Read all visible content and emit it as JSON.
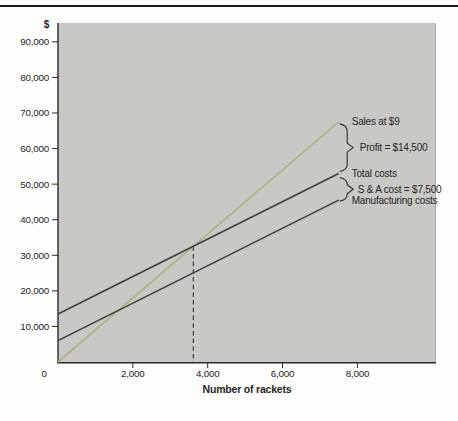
{
  "chart_data": {
    "type": "line",
    "title": "",
    "xlabel": "Number of rackets",
    "ylabel": "$",
    "xlim": [
      0,
      10100
    ],
    "ylim": [
      0,
      95300
    ],
    "x_ticks": [
      0,
      2000,
      4000,
      6000,
      8000
    ],
    "y_ticks": [
      10000,
      20000,
      30000,
      40000,
      50000,
      60000,
      70000,
      80000,
      90000
    ],
    "grid": false,
    "legend_position": "right-annotations",
    "plot_bg_color": "#c9c8c5",
    "series": [
      {
        "name": "Sales at $9",
        "color": "#b5b08a",
        "width": 1.8,
        "points": [
          [
            0,
            0
          ],
          [
            7500,
            67500
          ]
        ]
      },
      {
        "name": "Total costs",
        "color": "#3f3f3d",
        "width": 1.6,
        "points": [
          [
            0,
            13500
          ],
          [
            7500,
            53000
          ]
        ]
      },
      {
        "name": "Manufacturing costs",
        "color": "#3f3f3d",
        "width": 1.6,
        "points": [
          [
            0,
            6000
          ],
          [
            7500,
            45500
          ]
        ]
      }
    ],
    "break_even_marker": {
      "x": 3616,
      "y_top": 32550,
      "style": "dashed-vertical",
      "color": "#4a4a48"
    },
    "annotations": {
      "sales": "Sales at $9",
      "profit": "Profit = $14,500",
      "total_costs": "Total costs",
      "sa_cost": "S & A cost = $7,500",
      "manufacturing": "Manufacturing costs"
    },
    "colors": {
      "axis": "#2c2c2a",
      "text": "#262624",
      "brace": "#2e2e2c",
      "plot_right_border": "#b0b0ad",
      "top_rule": "#1b1b19"
    }
  }
}
